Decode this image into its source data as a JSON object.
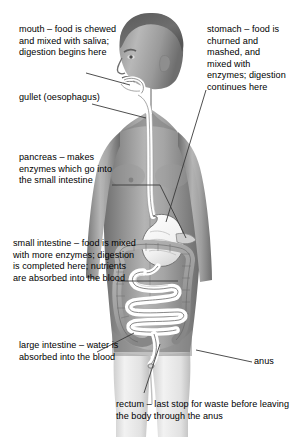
{
  "figure": {
    "background_color": "#ffffff",
    "text_color": "#000000",
    "leader_line_color": "#3a3a3a"
  },
  "labels": {
    "mouth": "mouth – food is chewed and mixed with saliva; digestion begins here",
    "gullet": "gullet (oesophagus)",
    "pancreas": "pancreas – makes enzymes which go into the small intestine",
    "small_intestine": "small intestine – food is mixed with more enzymes; digestion is completed here; nutrients are absorbed into the blood",
    "large_intestine": "large intestine – water is absorbed into the blood",
    "stomach": "stomach – food is churned and mashed, and mixed with enzymes; digestion continues here",
    "anus": "anus",
    "rectum": "rectum – last stop for waste before leaving the body through the anus"
  },
  "organs": [
    {
      "name": "mouth",
      "label_key": "mouth"
    },
    {
      "name": "oesophagus",
      "label_key": "gullet"
    },
    {
      "name": "stomach",
      "label_key": "stomach"
    },
    {
      "name": "pancreas",
      "label_key": "pancreas"
    },
    {
      "name": "small-intestine",
      "label_key": "small_intestine"
    },
    {
      "name": "large-intestine",
      "label_key": "large_intestine"
    },
    {
      "name": "rectum",
      "label_key": "rectum"
    },
    {
      "name": "anus",
      "label_key": "anus"
    }
  ]
}
